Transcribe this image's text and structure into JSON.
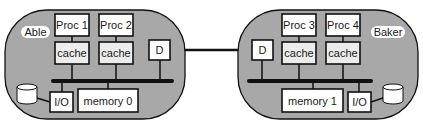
{
  "diagram": {
    "type": "multiprocessor-cluster",
    "colors": {
      "cluster_fill": "#a8a8a8",
      "box_fill": "#ffffff",
      "cache_fill": "#ececec",
      "stroke": "#111111",
      "label_pill": "#ffffff"
    },
    "clusters": [
      {
        "name": "Able",
        "processors": [
          "Proc 1",
          "Proc 2"
        ],
        "caches": [
          "cache",
          "cache"
        ],
        "directory": "D",
        "io": "I/O",
        "memory": "memory 0",
        "disk": "disk"
      },
      {
        "name": "Baker",
        "processors": [
          "Proc 3",
          "Proc 4"
        ],
        "caches": [
          "cache",
          "cache"
        ],
        "directory": "D",
        "io": "I/O",
        "memory": "memory 1",
        "disk": "disk"
      }
    ],
    "interconnect": "D-to-D link"
  }
}
